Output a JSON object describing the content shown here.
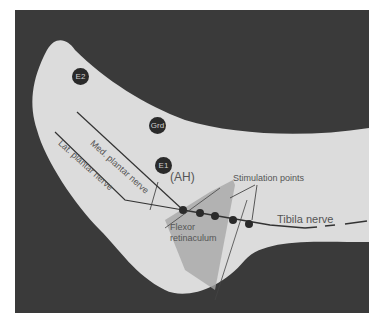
{
  "figure": {
    "type": "anatomical-diagram",
    "colors": {
      "background": "#3a3a3a",
      "skin": "#e0e0e0",
      "lines": "#333333",
      "text": "#555555",
      "electrode": "#2a2a2a"
    }
  },
  "electrodes": [
    {
      "id": "E2",
      "label": "E2"
    },
    {
      "id": "Grd",
      "label": "Grd"
    },
    {
      "id": "E1",
      "label": "E1"
    }
  ],
  "labels": {
    "ah": "(AH)",
    "med_plantar": "Med. plantar nerve",
    "lat_plantar": "Lat. plantar nerve",
    "stimulation": "Stimulation points",
    "tibial": "Tibila nerve",
    "flexor_1": "Flexor",
    "flexor_2": "retinaculum"
  },
  "stimulation_points_count": 5
}
